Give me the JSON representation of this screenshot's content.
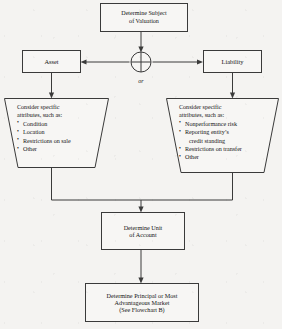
{
  "diagram": {
    "background_color": "#f4f3f1",
    "line_color": "#3a3a3a",
    "connector_symbol": "crossed-circle",
    "or_label": "or"
  },
  "nodes": {
    "subject": {
      "shape": "rectangle",
      "lines": [
        "Determine Subject",
        "of Valuation"
      ]
    },
    "asset": {
      "shape": "rectangle",
      "label": "Asset"
    },
    "liability": {
      "shape": "rectangle",
      "label": "Liability"
    },
    "asset_attributes": {
      "shape": "trapezoid",
      "heading_lines": [
        "Consider specific",
        "attributes, such as:"
      ],
      "bullets": [
        {
          "text": "Condition"
        },
        {
          "text": "Location"
        },
        {
          "text": "Restrictions on sale"
        },
        {
          "text": "Other"
        }
      ]
    },
    "liability_attributes": {
      "shape": "trapezoid",
      "heading_lines": [
        "Consider specific",
        "attributes, such as:"
      ],
      "bullets": [
        {
          "text": "Nonperformance risk"
        },
        {
          "text": "Reporting entity’s",
          "continuation": "credit standing"
        },
        {
          "text": "Restrictions on transfer"
        },
        {
          "text": "Other"
        }
      ]
    },
    "unit_of_account": {
      "shape": "rectangle",
      "lines": [
        "Determine Unit",
        "of Account"
      ]
    },
    "principal_market": {
      "shape": "rectangle",
      "lines": [
        "Determine Principal or Most",
        "Advantageous Market",
        "(See Flowchart B)"
      ]
    }
  }
}
